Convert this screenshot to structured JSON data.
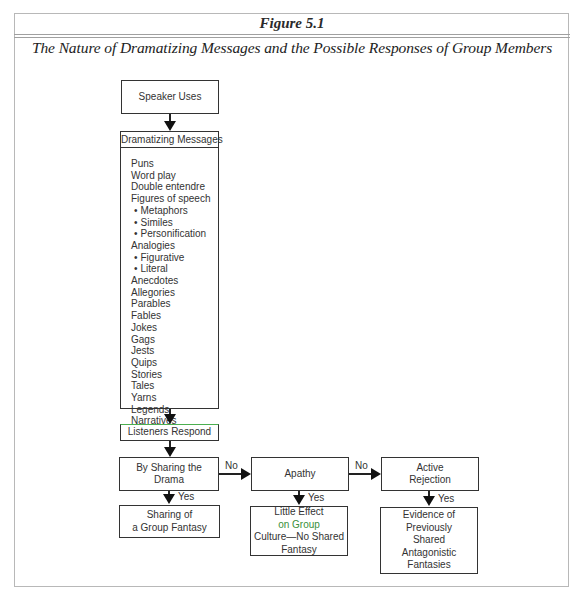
{
  "figure": {
    "label": "Figure 5.1",
    "title": "The Nature of Dramatizing Messages and the Possible Responses of Group Members"
  },
  "diagram": {
    "start": "Speaker Uses",
    "messages": {
      "header": "Dramatizing Messages",
      "items": [
        {
          "text": "Puns",
          "sub": false
        },
        {
          "text": "Word play",
          "sub": false
        },
        {
          "text": "Double entendre",
          "sub": false
        },
        {
          "text": "Figures of speech",
          "sub": false
        },
        {
          "text": "Metaphors",
          "sub": true
        },
        {
          "text": "Similes",
          "sub": true
        },
        {
          "text": "Personification",
          "sub": true
        },
        {
          "text": "Analogies",
          "sub": false
        },
        {
          "text": "Figurative",
          "sub": true
        },
        {
          "text": "Literal",
          "sub": true
        },
        {
          "text": "Anecdotes",
          "sub": false
        },
        {
          "text": "Allegories",
          "sub": false
        },
        {
          "text": "Parables",
          "sub": false
        },
        {
          "text": "Fables",
          "sub": false
        },
        {
          "text": "Jokes",
          "sub": false
        },
        {
          "text": "Gags",
          "sub": false
        },
        {
          "text": "Jests",
          "sub": false
        },
        {
          "text": "Quips",
          "sub": false
        },
        {
          "text": "Stories",
          "sub": false
        },
        {
          "text": "Tales",
          "sub": false
        },
        {
          "text": "Yarns",
          "sub": false
        },
        {
          "text": "Legends",
          "sub": false
        },
        {
          "text": "Narratives",
          "sub": false
        }
      ]
    },
    "listeners": "Listeners Respond",
    "responses": [
      {
        "decision_line1": "By Sharing the",
        "decision_line2": "Drama",
        "outcome_lines": [
          "Sharing of",
          "a Group Fantasy"
        ]
      },
      {
        "decision_line1": "Apathy",
        "decision_line2": "",
        "outcome_lines": [
          "Little Effect",
          "on Group",
          "Culture—No Shared",
          "Fantasy"
        ]
      },
      {
        "decision_line1": "Active",
        "decision_line2": "Rejection",
        "outcome_lines": [
          "Evidence of",
          "Previously",
          "Shared",
          "Antagonistic",
          "Fantasies"
        ]
      }
    ],
    "edge_labels": {
      "no": "No",
      "yes": "Yes"
    },
    "colors": {
      "line": "#222222",
      "highlight_green": "#4caf50"
    }
  }
}
